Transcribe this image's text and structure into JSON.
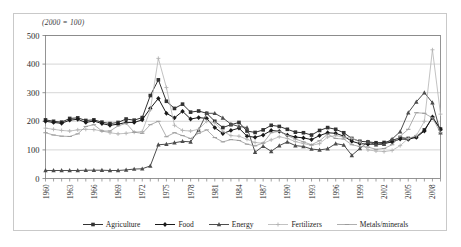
{
  "figure": {
    "subtitle": "(2000 = 100)"
  },
  "legend": {
    "position": "bottom",
    "entries": [
      {
        "label": "Agriculture",
        "color": "#333333",
        "marker": "square"
      },
      {
        "label": "Food",
        "color": "#1a1a1a",
        "marker": "diamond"
      },
      {
        "label": "Energy",
        "color": "#4d4d4d",
        "marker": "triangle"
      },
      {
        "label": "Fertilizers",
        "color": "#b3b3b3",
        "marker": "cross"
      },
      {
        "label": "Metals/minerals",
        "color": "#9a9a9a",
        "marker": "dash"
      }
    ]
  },
  "chart_data": {
    "type": "line",
    "title": "",
    "subtitle": "(2000 = 100)",
    "xlabel": "",
    "ylabel": "",
    "ylim": [
      0,
      500
    ],
    "yticks": [
      0,
      100,
      200,
      300,
      400,
      500
    ],
    "grid": true,
    "xtick_labels": [
      "1960",
      "1963",
      "1966",
      "1969",
      "1972",
      "1975",
      "1978",
      "1981",
      "1984",
      "1987",
      "1990",
      "1993",
      "1996",
      "1999",
      "2002",
      "2005",
      "2008"
    ],
    "x": [
      1960,
      1961,
      1962,
      1963,
      1964,
      1965,
      1966,
      1967,
      1968,
      1969,
      1970,
      1971,
      1972,
      1973,
      1974,
      1975,
      1976,
      1977,
      1978,
      1979,
      1980,
      1981,
      1982,
      1983,
      1984,
      1985,
      1986,
      1987,
      1988,
      1989,
      1990,
      1991,
      1992,
      1993,
      1994,
      1995,
      1996,
      1997,
      1998,
      1999,
      2000,
      2001,
      2002,
      2003,
      2004,
      2005,
      2006,
      2007,
      2008,
      2009
    ],
    "series": [
      {
        "name": "Agriculture",
        "color": "#333333",
        "marker": "square",
        "values": [
          205,
          200,
          197,
          210,
          212,
          203,
          205,
          197,
          192,
          196,
          208,
          204,
          213,
          290,
          345,
          270,
          245,
          260,
          232,
          236,
          228,
          200,
          178,
          188,
          196,
          166,
          161,
          170,
          186,
          182,
          172,
          162,
          160,
          152,
          168,
          178,
          172,
          160,
          140,
          130,
          128,
          125,
          126,
          133,
          143,
          140,
          146,
          170,
          212,
          173
        ]
      },
      {
        "name": "Food",
        "color": "#1a1a1a",
        "marker": "diamond",
        "values": [
          200,
          196,
          193,
          204,
          207,
          196,
          201,
          192,
          186,
          190,
          196,
          196,
          205,
          245,
          280,
          228,
          212,
          235,
          208,
          213,
          210,
          178,
          157,
          168,
          176,
          148,
          144,
          152,
          168,
          165,
          152,
          145,
          142,
          136,
          150,
          160,
          158,
          148,
          130,
          122,
          120,
          120,
          122,
          128,
          138,
          137,
          144,
          166,
          215,
          172
        ]
      },
      {
        "name": "Energy",
        "color": "#4d4d4d",
        "marker": "triangle",
        "values": [
          28,
          28,
          28,
          28,
          28,
          29,
          29,
          29,
          28,
          28,
          30,
          33,
          34,
          44,
          118,
          120,
          125,
          130,
          128,
          170,
          228,
          228,
          212,
          190,
          182,
          178,
          92,
          113,
          95,
          115,
          128,
          115,
          112,
          103,
          100,
          104,
          122,
          117,
          81,
          105,
          128,
          118,
          120,
          138,
          164,
          230,
          268,
          300,
          265,
          160
        ]
      },
      {
        "name": "Fertilizers",
        "color": "#b3b3b3",
        "marker": "cross",
        "values": [
          176,
          172,
          168,
          166,
          170,
          172,
          171,
          166,
          160,
          156,
          158,
          162,
          164,
          240,
          420,
          318,
          186,
          168,
          166,
          172,
          200,
          195,
          165,
          150,
          148,
          137,
          126,
          123,
          135,
          146,
          140,
          129,
          122,
          116,
          122,
          145,
          150,
          145,
          141,
          128,
          100,
          96,
          94,
          98,
          115,
          140,
          150,
          200,
          450,
          225
        ]
      },
      {
        "name": "Metals/minerals",
        "color": "#9a9a9a",
        "marker": "dash",
        "values": [
          160,
          152,
          148,
          147,
          156,
          182,
          188,
          166,
          166,
          184,
          193,
          162,
          158,
          188,
          200,
          146,
          160,
          150,
          140,
          158,
          170,
          143,
          128,
          136,
          133,
          120,
          114,
          124,
          160,
          165,
          150,
          138,
          128,
          118,
          132,
          155,
          140,
          138,
          118,
          112,
          110,
          102,
          105,
          118,
          148,
          172,
          230,
          228,
          212,
          160
        ]
      }
    ]
  }
}
